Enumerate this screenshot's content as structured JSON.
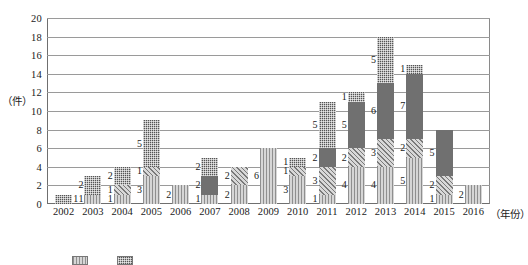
{
  "chart_data": {
    "type": "bar",
    "subtype": "stacked-bar",
    "title": "",
    "xlabel": "（年份）",
    "ylabel": "（件）",
    "ylim": [
      0,
      20
    ],
    "yticks": [
      0,
      2,
      4,
      6,
      8,
      10,
      12,
      14,
      16,
      18,
      20
    ],
    "grid": true,
    "legend_position": "bottom",
    "categories": [
      "2002",
      "2003",
      "2004",
      "2005",
      "2006",
      "2007",
      "2008",
      "2009",
      "2010",
      "2011",
      "2012",
      "2013",
      "2014",
      "2015",
      "2016"
    ],
    "series": [
      {
        "name": "系列一",
        "pattern": "vertical-stripes",
        "color": "#c9c9c9",
        "values": [
          0,
          1,
          1,
          3,
          2,
          1,
          2,
          6,
          3,
          1,
          4,
          4,
          5,
          1,
          2
        ]
      },
      {
        "name": "系列二",
        "pattern": "diagonal-hatch",
        "color": "#bdbdbd",
        "values": [
          0,
          0,
          1,
          1,
          0,
          0,
          2,
          0,
          1,
          3,
          2,
          3,
          2,
          2,
          0
        ]
      },
      {
        "name": "系列三",
        "pattern": "solid-gray",
        "color": "#707070",
        "values": [
          0,
          0,
          0,
          0,
          0,
          2,
          0,
          0,
          0,
          2,
          5,
          6,
          7,
          5,
          0
        ]
      },
      {
        "name": "系列四",
        "pattern": "checkerboard",
        "color": "#555555",
        "values": [
          1,
          2,
          2,
          5,
          0,
          2,
          0,
          0,
          1,
          5,
          1,
          5,
          1,
          0,
          0
        ]
      }
    ],
    "totals": [
      1,
      3,
      4,
      9,
      2,
      5,
      4,
      6,
      5,
      11,
      12,
      18,
      15,
      8,
      2
    ]
  },
  "legend": {
    "items": [
      {
        "label": "",
        "pattern": "vertical-stripes"
      },
      {
        "label": "",
        "pattern": "checkerboard"
      }
    ]
  }
}
